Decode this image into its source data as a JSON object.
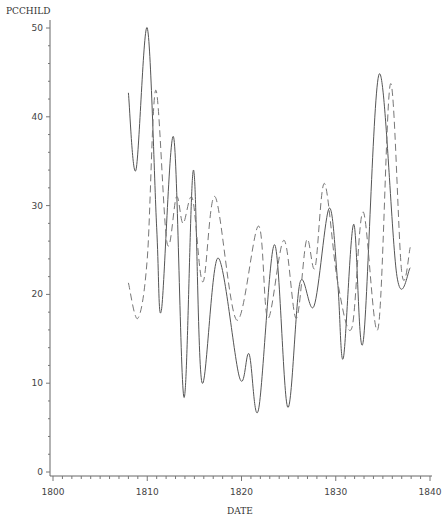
{
  "chart_data": {
    "type": "line",
    "title": "",
    "xlabel": "DATE",
    "ylabel": "PCCHILD",
    "xlim": [
      1800,
      1840
    ],
    "ylim": [
      0,
      50
    ],
    "x_ticks": [
      1800,
      1810,
      1820,
      1830,
      1840
    ],
    "y_ticks": [
      0,
      10,
      20,
      30,
      40,
      50
    ],
    "grid": false,
    "legend": null,
    "series": [
      {
        "name": "solid",
        "style": "solid",
        "color": "#555555",
        "points": [
          [
            1808.0,
            42.7
          ],
          [
            1808.8,
            34.0
          ],
          [
            1810.0,
            50.0
          ],
          [
            1811.0,
            27.5
          ],
          [
            1811.5,
            18.2
          ],
          [
            1812.8,
            37.7
          ],
          [
            1813.9,
            8.4
          ],
          [
            1814.9,
            34.0
          ],
          [
            1815.8,
            10.1
          ],
          [
            1817.5,
            24.1
          ],
          [
            1819.8,
            10.6
          ],
          [
            1820.8,
            13.3
          ],
          [
            1821.8,
            7.0
          ],
          [
            1823.5,
            25.6
          ],
          [
            1824.9,
            7.3
          ],
          [
            1826.2,
            21.3
          ],
          [
            1827.7,
            18.7
          ],
          [
            1829.3,
            29.7
          ],
          [
            1830.2,
            21.4
          ],
          [
            1830.8,
            12.8
          ],
          [
            1831.9,
            27.9
          ],
          [
            1832.9,
            14.6
          ],
          [
            1834.6,
            44.8
          ],
          [
            1836.5,
            22.0
          ],
          [
            1837.9,
            23.0
          ]
        ]
      },
      {
        "name": "dashed",
        "style": "dashed",
        "color": "#777777",
        "points": [
          [
            1808.0,
            21.3
          ],
          [
            1809.0,
            17.3
          ],
          [
            1810.0,
            24.0
          ],
          [
            1810.9,
            43.0
          ],
          [
            1812.1,
            25.8
          ],
          [
            1813.1,
            31.0
          ],
          [
            1813.8,
            28.0
          ],
          [
            1814.8,
            30.8
          ],
          [
            1815.9,
            21.4
          ],
          [
            1817.2,
            31.0
          ],
          [
            1819.5,
            17.1
          ],
          [
            1821.8,
            27.7
          ],
          [
            1822.8,
            17.3
          ],
          [
            1824.5,
            26.1
          ],
          [
            1825.8,
            17.3
          ],
          [
            1826.9,
            26.1
          ],
          [
            1827.8,
            23.0
          ],
          [
            1828.8,
            32.5
          ],
          [
            1830.2,
            21.4
          ],
          [
            1831.7,
            16.2
          ],
          [
            1832.9,
            29.3
          ],
          [
            1834.5,
            16.2
          ],
          [
            1835.8,
            43.7
          ],
          [
            1837.0,
            22.5
          ],
          [
            1837.9,
            25.3
          ]
        ]
      }
    ]
  },
  "axes": {
    "y_label": "PCCHILD",
    "x_label": "DATE",
    "y_tick_labels": [
      "0",
      "10",
      "20",
      "30",
      "40",
      "50"
    ],
    "x_tick_labels": [
      "1800",
      "1810",
      "1820",
      "1830",
      "1840"
    ]
  }
}
